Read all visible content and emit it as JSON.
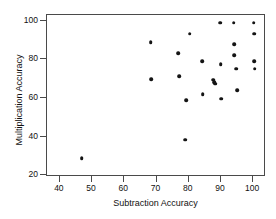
{
  "chart_data": {
    "type": "scatter",
    "title": "",
    "xlabel": "Subtraction Accuracy",
    "ylabel": "Multiplication Accuracy",
    "xlim": [
      36,
      104
    ],
    "ylim": [
      19,
      103
    ],
    "xticks": [
      40,
      50,
      60,
      70,
      80,
      90,
      100
    ],
    "yticks": [
      20,
      40,
      60,
      80,
      100
    ],
    "xtick_labels": [
      "40",
      "50",
      "60",
      "70",
      "80",
      "90",
      "100"
    ],
    "ytick_labels": [
      "20",
      "40",
      "60",
      "80",
      "100"
    ],
    "grid": false,
    "legend": false,
    "marker": "filled-circle",
    "marker_color": "#141414",
    "frame_color": "#4a4a4a",
    "background": "#ffffff",
    "points": [
      {
        "x": 46.8,
        "y": 28.6
      },
      {
        "x": 68.2,
        "y": 88.8
      },
      {
        "x": 68.3,
        "y": 69.6
      },
      {
        "x": 76.8,
        "y": 83.3
      },
      {
        "x": 77.1,
        "y": 71.3
      },
      {
        "x": 79.0,
        "y": 38.4
      },
      {
        "x": 79.2,
        "y": 58.7
      },
      {
        "x": 80.3,
        "y": 93.2
      },
      {
        "x": 84.2,
        "y": 78.9
      },
      {
        "x": 84.4,
        "y": 61.9
      },
      {
        "x": 87.6,
        "y": 69.4
      },
      {
        "x": 88.0,
        "y": 68.2
      },
      {
        "x": 88.2,
        "y": 67.3
      },
      {
        "x": 89.8,
        "y": 99.0
      },
      {
        "x": 89.9,
        "y": 77.4
      },
      {
        "x": 90.1,
        "y": 59.7
      },
      {
        "x": 94.0,
        "y": 99.0
      },
      {
        "x": 94.1,
        "y": 87.8
      },
      {
        "x": 94.2,
        "y": 82.1
      },
      {
        "x": 94.8,
        "y": 75.1
      },
      {
        "x": 95.0,
        "y": 64.0
      },
      {
        "x": 100.2,
        "y": 99.0
      },
      {
        "x": 100.3,
        "y": 93.3
      },
      {
        "x": 100.4,
        "y": 78.9
      },
      {
        "x": 100.5,
        "y": 75.2
      }
    ]
  }
}
